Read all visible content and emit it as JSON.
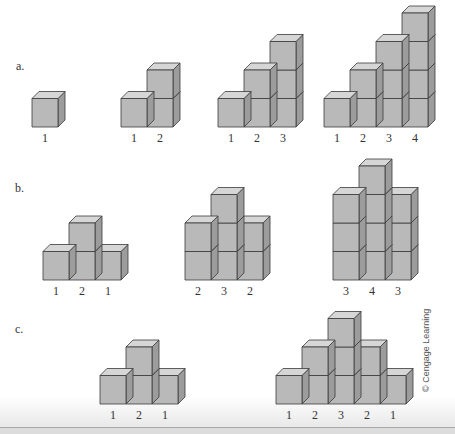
{
  "parts": {
    "a": {
      "label": "a."
    },
    "b": {
      "label": "b."
    },
    "c": {
      "label": "c."
    }
  },
  "credit": "© Cengage Learning",
  "colors": {
    "front": "#b9b9b9",
    "top": "#d6d6d6",
    "side": "#9c9c9c",
    "edge": "#3a3a3a",
    "text": "#333333"
  },
  "chart_data": {
    "type": "diagram",
    "title": "",
    "cube": {
      "width": 26,
      "height": 28.5,
      "depth_dx": 7,
      "depth_dy": 7
    },
    "groups": [
      {
        "part": "a",
        "x": 32,
        "base_y": 127,
        "columns": [
          1
        ],
        "labels": [
          "1"
        ]
      },
      {
        "part": "a",
        "x": 121,
        "base_y": 127,
        "columns": [
          1,
          2
        ],
        "labels": [
          "1",
          "2"
        ]
      },
      {
        "part": "a",
        "x": 218,
        "base_y": 127,
        "columns": [
          1,
          2,
          3
        ],
        "labels": [
          "1",
          "2",
          "3"
        ]
      },
      {
        "part": "a",
        "x": 324,
        "base_y": 127,
        "columns": [
          1,
          2,
          3,
          4
        ],
        "labels": [
          "1",
          "2",
          "3",
          "4"
        ]
      },
      {
        "part": "b",
        "x": 43,
        "base_y": 280,
        "columns": [
          1,
          2,
          1
        ],
        "labels": [
          "1",
          "2",
          "1"
        ]
      },
      {
        "part": "b",
        "x": 185,
        "base_y": 280,
        "columns": [
          2,
          3,
          2
        ],
        "labels": [
          "2",
          "3",
          "2"
        ]
      },
      {
        "part": "b",
        "x": 333,
        "base_y": 280,
        "columns": [
          3,
          4,
          3
        ],
        "labels": [
          "3",
          "4",
          "3"
        ]
      },
      {
        "part": "c",
        "x": 100,
        "base_y": 404,
        "columns": [
          1,
          2,
          1
        ],
        "labels": [
          "1",
          "2",
          "1"
        ]
      },
      {
        "part": "c",
        "x": 276,
        "base_y": 404,
        "columns": [
          1,
          2,
          3,
          2,
          1
        ],
        "labels": [
          "1",
          "2",
          "3",
          "2",
          "1"
        ]
      }
    ]
  }
}
